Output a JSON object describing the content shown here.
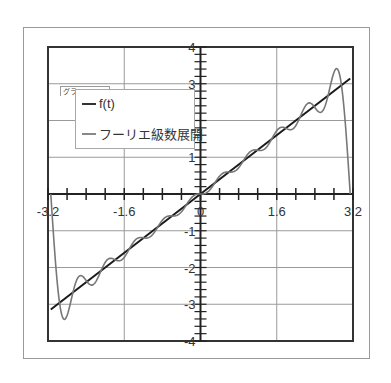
{
  "tooltip": "グラフ エリア",
  "legend": {
    "items": [
      {
        "label": "f(t)",
        "color": "#1a1a1a"
      },
      {
        "label": "フーリエ級数展開",
        "color": "#777777"
      }
    ]
  },
  "chart_data": {
    "type": "line",
    "title": "",
    "xlabel": "",
    "ylabel": "",
    "xlim": [
      -3.2,
      3.2
    ],
    "ylim": [
      -4,
      4
    ],
    "x_ticks": [
      -3.2,
      -1.6,
      0,
      1.6,
      3.2
    ],
    "x_tick_labels": [
      "-3.2",
      "-1.6",
      "0",
      "1.6",
      "3.2"
    ],
    "y_ticks": [
      -4,
      -3,
      -2,
      -1,
      0,
      1,
      2,
      3,
      4
    ],
    "y_tick_labels": [
      "-4",
      "-3",
      "-2",
      "-1",
      "0",
      "1",
      "2",
      "3",
      "4"
    ],
    "x_minor_step": 0.4,
    "y_minor_step": 0.2,
    "grid": true,
    "legend_position": "upper-left",
    "series": [
      {
        "name": "f(t)",
        "description": "f(t) = t on [-π, π]",
        "color": "#1a1a1a",
        "x": [
          -3.1416,
          3.1416
        ],
        "y": [
          -3.1416,
          3.1416
        ]
      },
      {
        "name": "フーリエ級数展開",
        "description": "Fourier series of f(t)=t, sum_{n=1}^{10} 2(-1)^{n+1} sin(nt)/n",
        "color": "#777777",
        "terms": 10,
        "x": [
          -3.1416,
          -3.0,
          -2.85,
          -2.7,
          -2.5,
          -2.2,
          -1.9,
          -1.6,
          -1.3,
          -1.0,
          -0.5,
          0,
          0.5,
          1.0,
          1.3,
          1.6,
          1.9,
          2.2,
          2.5,
          2.7,
          2.85,
          3.0,
          3.1416
        ],
        "y": [
          0.0,
          -2.2,
          -3.4,
          -3.0,
          -2.3,
          -2.3,
          -1.9,
          -1.6,
          -1.3,
          -1.0,
          -0.5,
          0.0,
          0.5,
          1.0,
          1.3,
          1.6,
          1.9,
          2.3,
          2.3,
          3.0,
          3.4,
          2.2,
          0.0
        ]
      }
    ]
  }
}
